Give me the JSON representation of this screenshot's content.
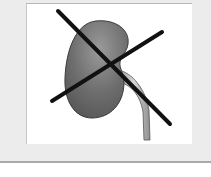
{
  "image": {
    "subject": "kidney-with-ureter",
    "overlay": "cross-mark",
    "alt_text": "Crossed-out kidney illustration"
  },
  "colors": {
    "frame_background": "#ececec",
    "panel_background": "#ffffff",
    "kidney_fill": "#6f6f6f",
    "kidney_outline": "#3a3a3a",
    "ureter_fill": "#c4c4c4",
    "cross_stroke": "#111111"
  }
}
